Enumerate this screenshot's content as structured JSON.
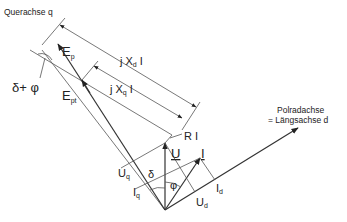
{
  "diagram": {
    "axes": {
      "q_axis_label": "Querachse q",
      "d_axis_label_line1": "Polradachse",
      "d_axis_label_line2": "= Längsachse d"
    },
    "vectors": {
      "Ep": {
        "main": "E",
        "sub": "p"
      },
      "Ept": {
        "main": "E",
        "sub": "pt"
      },
      "U": {
        "main": "U"
      },
      "I": {
        "main": "I"
      },
      "Uq": {
        "main": "U",
        "sub": "q"
      },
      "Ud": {
        "main": "U",
        "sub": "d"
      },
      "Iq": {
        "main": "I",
        "sub": "q"
      },
      "Id": {
        "main": "I",
        "sub": "d"
      }
    },
    "dimension_labels": {
      "jXdI": {
        "prefix": "j X",
        "sub": "d",
        "suffix": " I"
      },
      "jXqI": {
        "prefix": "j X",
        "sub": "q",
        "suffix": " I"
      },
      "RI": "R I"
    },
    "angles": {
      "delta_plus_phi": "δ+ φ",
      "delta": "δ",
      "phi": "φ"
    },
    "colors": {
      "line": "#333333",
      "text": "#222222",
      "background": "#ffffff"
    }
  }
}
